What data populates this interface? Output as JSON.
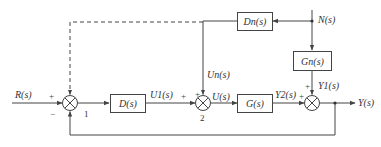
{
  "diagram": {
    "type": "control-block-diagram",
    "blocks": {
      "D": "D(s)",
      "G": "G(s)",
      "Dn": "Dn(s)",
      "Gn": "Gn(s)"
    },
    "signals": {
      "input": "R(s)",
      "disturbance": "N(s)",
      "output": "Y(s)",
      "u1": "U1(s)",
      "u": "U(s)",
      "un": "Un(s)",
      "y1": "Y1(s)",
      "y2": "Y2(s)"
    },
    "summing_junction_labels": {
      "sum1": "1",
      "sum2": "2"
    },
    "signs": {
      "sum1_input": "+",
      "sum1_feedback": "−",
      "sum2_u1": "+",
      "sum2_un": "+",
      "sum3_y2": "+",
      "sum3_y1": "+"
    },
    "colors": {
      "line": "#444444",
      "text": "#333333",
      "background": "#ffffff"
    }
  }
}
